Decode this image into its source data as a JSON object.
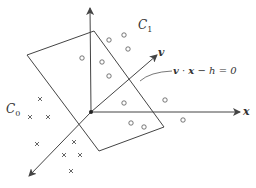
{
  "diagram": {
    "colors": {
      "stroke": "#444444",
      "point": "#555555",
      "background": "#ffffff"
    },
    "axes": {
      "origin": [
        91,
        112
      ],
      "y_tip": [
        90,
        8
      ],
      "x_tip": [
        240,
        112
      ],
      "neg_tip": [
        29,
        176
      ],
      "x_label": "x"
    },
    "vector": {
      "label": "v",
      "tip": [
        157,
        55
      ]
    },
    "plane": {
      "corners": [
        [
          27,
          55
        ],
        [
          94,
          31
        ],
        [
          164,
          127
        ],
        [
          99,
          151
        ]
      ],
      "equation_parts": [
        "v",
        " · ",
        "x",
        " − h = 0"
      ]
    },
    "classes": {
      "c1": {
        "label_main": "C",
        "label_sub": "1",
        "marker": "circle"
      },
      "c0": {
        "label_main": "C",
        "label_sub": "0",
        "marker": "cross"
      }
    },
    "circles": [
      [
        82,
        58
      ],
      [
        109,
        40
      ],
      [
        124,
        35
      ],
      [
        128,
        49
      ],
      [
        102,
        62
      ],
      [
        109,
        76
      ],
      [
        124,
        103
      ],
      [
        165,
        100
      ],
      [
        131,
        123
      ],
      [
        144,
        127
      ],
      [
        183,
        120
      ]
    ],
    "crosses": [
      [
        40,
        99
      ],
      [
        30,
        117
      ],
      [
        48,
        117
      ],
      [
        37,
        144
      ],
      [
        74,
        142
      ],
      [
        64,
        155
      ],
      [
        80,
        155
      ],
      [
        71,
        171
      ]
    ]
  }
}
